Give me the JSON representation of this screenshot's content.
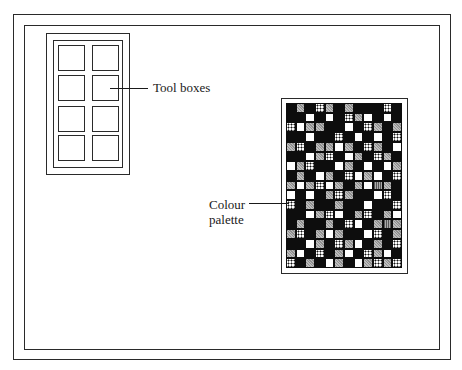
{
  "diagram": {
    "labels": {
      "tool_boxes": "Tool boxes",
      "colour_line1": "Colour",
      "colour_line2": "palette"
    },
    "toolbox": {
      "rows": 4,
      "cols": 2
    },
    "palette": {
      "cols": 12,
      "rows": 17,
      "cell_legend": {
        "k": "black",
        "w": "white",
        "g": "grey-hatched",
        "d": "dotted",
        "s": "striped"
      },
      "pattern": [
        "kgkdgkgkkkdk",
        "kkwkwkdgwkwk",
        "dwggkkwkdgkg",
        "kkwkkdkwkwkd",
        "gdkggwgkdgkw",
        "kkwgdkwgkdgk",
        "wgdkkwgkwkwg",
        "kgkwgkdwgwkd",
        "gwgdwgkgwsgk",
        "wkwkgdgkkwdk",
        "dkgkkgkkwkkd",
        "kkwgdwkgdkgw",
        "kgkkgkdwkgsg",
        "gdkgwgkkwdkg",
        "kkwgkdgwkgkd",
        "gwkdkgwkdgwk",
        "dkgkwgkwgdgd"
      ]
    },
    "colors": {
      "line": "#2a2a2a",
      "background": "#ffffff",
      "palette_bg": "#0d0d0d"
    }
  }
}
